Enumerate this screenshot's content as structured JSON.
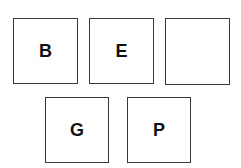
{
  "boxes": [
    {
      "label": "B"
    },
    {
      "label": "E"
    },
    {
      "label": ""
    },
    {
      "label": "G"
    },
    {
      "label": "P"
    }
  ]
}
